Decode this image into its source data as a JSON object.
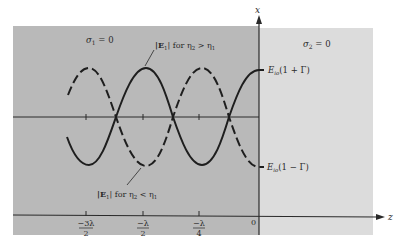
{
  "diagram": {
    "colors": {
      "region1": "#b9b9b9",
      "region2": "#dcdcdc",
      "ink": "#2a2a2a",
      "background": "#ffffff"
    },
    "axes": {
      "vertical_label": "x",
      "horizontal_label": "z",
      "origin_label": "0"
    },
    "regions": {
      "left_label_sym": "σ",
      "left_label_sub": "1",
      "left_label_rest": " = 0",
      "right_label_sym": "σ",
      "right_label_sub": "2",
      "right_label_rest": " = 0"
    },
    "curves": {
      "upper_label_prefix": "|E",
      "upper_label_sub": "1",
      "upper_label_mid": "| for η",
      "upper_label_sub2": "2",
      "upper_label_rel": " > η",
      "upper_label_sub3": "1",
      "lower_label_prefix": "|E",
      "lower_label_sub": "1",
      "lower_label_mid": "| for η",
      "lower_label_sub2": "2",
      "lower_label_rel": " < η",
      "lower_label_sub3": "1"
    },
    "level_labels": {
      "max_E": "E",
      "max_sub": "io",
      "max_rest": "(1 + Γ)",
      "min_E": "E",
      "min_sub": "io",
      "min_rest": "(1 − Γ)"
    },
    "ticks": [
      {
        "num": "−3λ",
        "den": "2"
      },
      {
        "num": "−λ",
        "den": "2"
      },
      {
        "num": "−λ",
        "den": "4"
      }
    ]
  }
}
